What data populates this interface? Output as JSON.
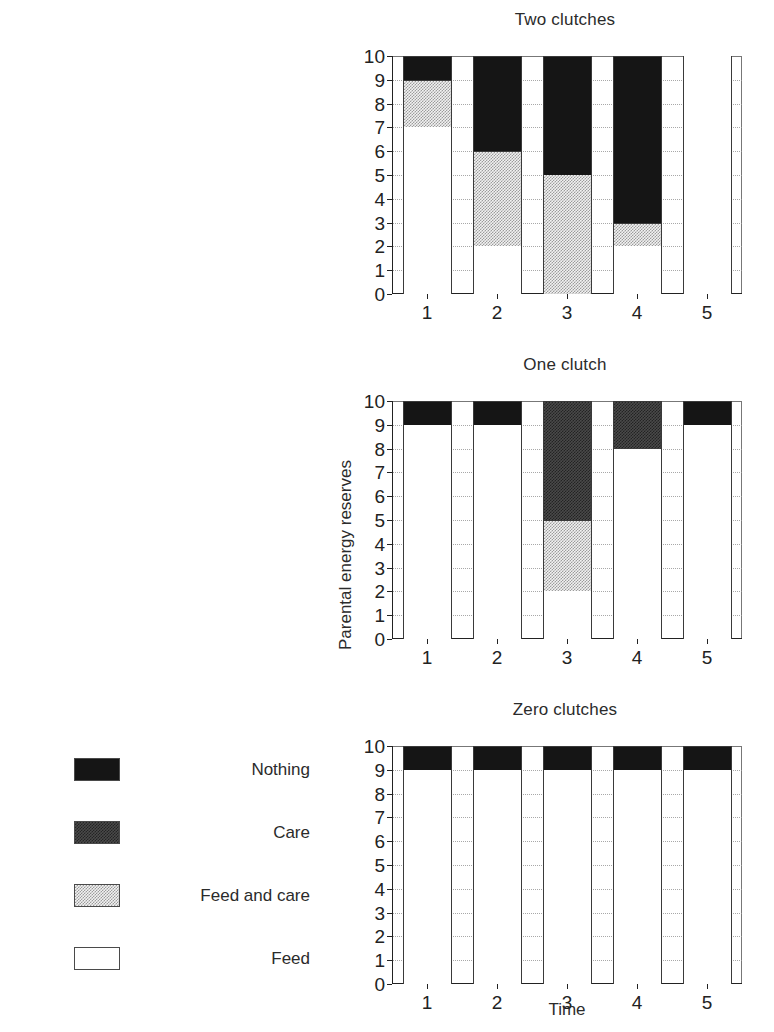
{
  "figure": {
    "ylabel": "Parental energy reserves",
    "xlabel": "Time"
  },
  "legend": {
    "items": [
      {
        "label": "Nothing",
        "key": "nothing",
        "pattern": "solid-black"
      },
      {
        "label": "Care",
        "key": "care",
        "pattern": "dark-checker"
      },
      {
        "label": "Feed and care",
        "key": "feedcare",
        "pattern": "light-stipple"
      },
      {
        "label": "Feed",
        "key": "feed",
        "pattern": "white"
      }
    ]
  },
  "chart_data": {
    "type": "bar",
    "xlabel": "Time",
    "ylabel": "Parental energy reserves",
    "categories": [
      "1",
      "2",
      "3",
      "4",
      "5"
    ],
    "yticks": [
      "10",
      "9",
      "8",
      "7",
      "6",
      "5",
      "4",
      "3",
      "2",
      "1",
      "0"
    ],
    "ylim": [
      0,
      10
    ],
    "grid": "dotted-horizontal",
    "legend_position": "lower-left-outside",
    "stacking": "stacked",
    "series_order": [
      "feed",
      "feedcare",
      "care",
      "nothing"
    ],
    "panels": [
      {
        "title": "Two clutches",
        "bars": [
          {
            "x": "1",
            "segments": [
              {
                "key": "feed",
                "label": "Feed",
                "from": 0,
                "to": 7
              },
              {
                "key": "feedcare",
                "label": "Feed and care",
                "from": 7,
                "to": 9
              },
              {
                "key": "nothing",
                "label": "Nothing",
                "from": 9,
                "to": 10
              }
            ]
          },
          {
            "x": "2",
            "segments": [
              {
                "key": "feed",
                "label": "Feed",
                "from": 0,
                "to": 2
              },
              {
                "key": "feedcare",
                "label": "Feed and care",
                "from": 2,
                "to": 6
              },
              {
                "key": "nothing",
                "label": "Nothing",
                "from": 6,
                "to": 10
              }
            ]
          },
          {
            "x": "3",
            "segments": [
              {
                "key": "feedcare",
                "label": "Feed and care",
                "from": 0,
                "to": 5
              },
              {
                "key": "nothing",
                "label": "Nothing",
                "from": 5,
                "to": 10
              }
            ]
          },
          {
            "x": "4",
            "segments": [
              {
                "key": "feed",
                "label": "Feed",
                "from": 0,
                "to": 2
              },
              {
                "key": "feedcare",
                "label": "Feed and care",
                "from": 2,
                "to": 3
              },
              {
                "key": "nothing",
                "label": "Nothing",
                "from": 3,
                "to": 10
              }
            ]
          },
          {
            "x": "5",
            "segments": [
              {
                "key": "feed",
                "label": "Feed",
                "from": 0,
                "to": 10
              }
            ]
          }
        ]
      },
      {
        "title": "One clutch",
        "bars": [
          {
            "x": "1",
            "segments": [
              {
                "key": "feed",
                "label": "Feed",
                "from": 0,
                "to": 9
              },
              {
                "key": "nothing",
                "label": "Nothing",
                "from": 9,
                "to": 10
              }
            ]
          },
          {
            "x": "2",
            "segments": [
              {
                "key": "feed",
                "label": "Feed",
                "from": 0,
                "to": 9
              },
              {
                "key": "nothing",
                "label": "Nothing",
                "from": 9,
                "to": 10
              }
            ]
          },
          {
            "x": "3",
            "segments": [
              {
                "key": "feed",
                "label": "Feed",
                "from": 0,
                "to": 2
              },
              {
                "key": "feedcare",
                "label": "Feed and care",
                "from": 2,
                "to": 5
              },
              {
                "key": "care",
                "label": "Care",
                "from": 5,
                "to": 10
              }
            ]
          },
          {
            "x": "4",
            "segments": [
              {
                "key": "feed",
                "label": "Feed",
                "from": 0,
                "to": 8
              },
              {
                "key": "care",
                "label": "Care",
                "from": 8,
                "to": 10
              }
            ]
          },
          {
            "x": "5",
            "segments": [
              {
                "key": "feed",
                "label": "Feed",
                "from": 0,
                "to": 9
              },
              {
                "key": "nothing",
                "label": "Nothing",
                "from": 9,
                "to": 10
              }
            ]
          }
        ]
      },
      {
        "title": "Zero clutches",
        "bars": [
          {
            "x": "1",
            "segments": [
              {
                "key": "feed",
                "label": "Feed",
                "from": 0,
                "to": 9
              },
              {
                "key": "nothing",
                "label": "Nothing",
                "from": 9,
                "to": 10
              }
            ]
          },
          {
            "x": "2",
            "segments": [
              {
                "key": "feed",
                "label": "Feed",
                "from": 0,
                "to": 9
              },
              {
                "key": "nothing",
                "label": "Nothing",
                "from": 9,
                "to": 10
              }
            ]
          },
          {
            "x": "3",
            "segments": [
              {
                "key": "feed",
                "label": "Feed",
                "from": 0,
                "to": 9
              },
              {
                "key": "nothing",
                "label": "Nothing",
                "from": 9,
                "to": 10
              }
            ]
          },
          {
            "x": "4",
            "segments": [
              {
                "key": "feed",
                "label": "Feed",
                "from": 0,
                "to": 9
              },
              {
                "key": "nothing",
                "label": "Nothing",
                "from": 9,
                "to": 10
              }
            ]
          },
          {
            "x": "5",
            "segments": [
              {
                "key": "feed",
                "label": "Feed",
                "from": 0,
                "to": 9
              },
              {
                "key": "nothing",
                "label": "Nothing",
                "from": 9,
                "to": 10
              }
            ]
          }
        ]
      }
    ]
  }
}
